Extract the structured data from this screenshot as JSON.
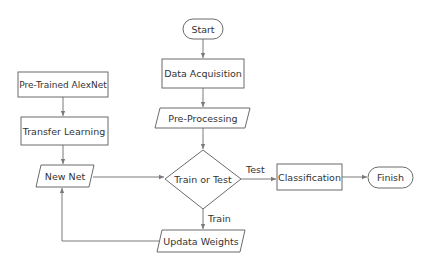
{
  "diagram": {
    "type": "flowchart",
    "nodes": {
      "start": {
        "label": "Start",
        "shape": "terminal"
      },
      "data_acquisition": {
        "label": "Data Acquisition",
        "shape": "process"
      },
      "pre_processing": {
        "label": "Pre-Processing",
        "shape": "io"
      },
      "train_or_test": {
        "label": "Train or Test",
        "shape": "decision"
      },
      "update_weights": {
        "label": "Updata Weights",
        "shape": "io"
      },
      "pretrained_alexnet": {
        "label": "Pre-Trained AlexNet",
        "shape": "process"
      },
      "transfer_learning": {
        "label": "Transfer Learning",
        "shape": "process"
      },
      "new_net": {
        "label": "New Net",
        "shape": "io"
      },
      "classification": {
        "label": "Classification",
        "shape": "process"
      },
      "finish": {
        "label": "Finish",
        "shape": "terminal"
      }
    },
    "edges": {
      "test_label": "Test",
      "train_label": "Train"
    },
    "colors": {
      "stroke": "#6b6b6b",
      "text": "#333333",
      "background": "#ffffff"
    }
  }
}
